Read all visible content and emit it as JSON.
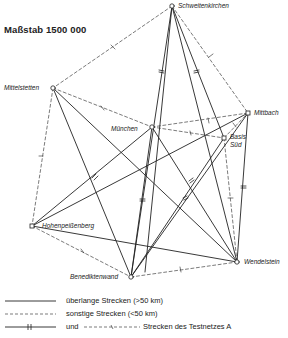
{
  "title": "Maßstab 1500 000",
  "stations": [
    {
      "id": "schweitenkirchen",
      "name": "Schweitenkirchen",
      "x": 172,
      "y": 6
    },
    {
      "id": "mittelstetten",
      "name": "Mittelstetten",
      "x": 53,
      "y": 88
    },
    {
      "id": "muenchen",
      "name": "München",
      "x": 152,
      "y": 127
    },
    {
      "id": "mittbach",
      "name": "Mittbach",
      "x": 248,
      "y": 113
    },
    {
      "id": "basis_sued",
      "name_line1": "Basis",
      "name_line2": "Süd",
      "x": 224,
      "y": 138
    },
    {
      "id": "hohenpeissenberg",
      "name": "Hohenpeißenberg",
      "x": 32,
      "y": 226
    },
    {
      "id": "benediktenwand",
      "name": "Benediktenwand",
      "x": 131,
      "y": 277
    },
    {
      "id": "wendelstein",
      "name": "Wendelstein",
      "x": 237,
      "y": 262
    }
  ],
  "legend": {
    "solid_label": "überlange Strecken (>50 km)",
    "dashed_label": "sonstige Strecken (<50 km)",
    "test_prefix": "und",
    "test_label": "Strecken des Testnetzes A"
  },
  "colors": {
    "line": "#222222",
    "background": "#ffffff"
  }
}
